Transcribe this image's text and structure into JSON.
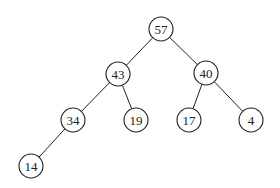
{
  "diagram": {
    "type": "binary-tree",
    "nodes": [
      {
        "id": "n57",
        "label": "57",
        "x": 161,
        "y": 29
      },
      {
        "id": "n43",
        "label": "43",
        "x": 118,
        "y": 74
      },
      {
        "id": "n40",
        "label": "40",
        "x": 206,
        "y": 73
      },
      {
        "id": "n34",
        "label": "34",
        "x": 73,
        "y": 120
      },
      {
        "id": "n19",
        "label": "19",
        "x": 136,
        "y": 120
      },
      {
        "id": "n17",
        "label": "17",
        "x": 189,
        "y": 120
      },
      {
        "id": "n4",
        "label": "4",
        "x": 251,
        "y": 120
      },
      {
        "id": "n14",
        "label": "14",
        "x": 31,
        "y": 166
      }
    ],
    "edges": [
      {
        "from": "n57",
        "to": "n43"
      },
      {
        "from": "n57",
        "to": "n40"
      },
      {
        "from": "n43",
        "to": "n34"
      },
      {
        "from": "n43",
        "to": "n19"
      },
      {
        "from": "n40",
        "to": "n17"
      },
      {
        "from": "n40",
        "to": "n4"
      },
      {
        "from": "n34",
        "to": "n14"
      }
    ],
    "node_radius": 12
  }
}
